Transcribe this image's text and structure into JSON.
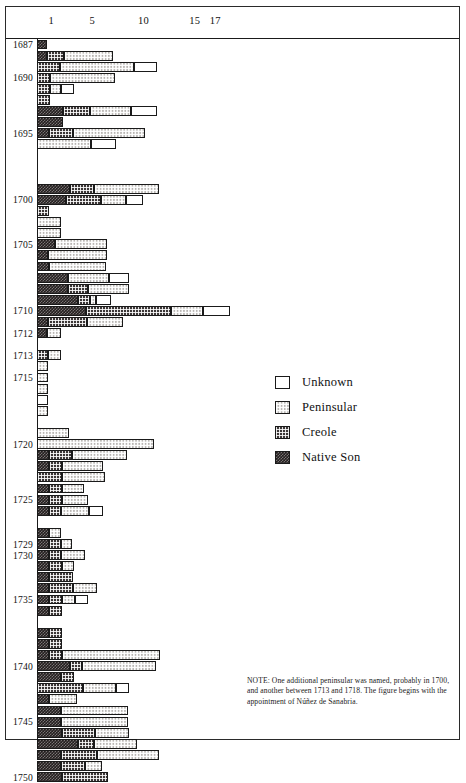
{
  "chart_data": {
    "type": "bar",
    "orientation": "horizontal",
    "stacked": true,
    "title": "",
    "xlabel": "",
    "ylabel": "",
    "xlim": [
      0,
      20
    ],
    "xticks": [
      1,
      5,
      10,
      15,
      17
    ],
    "xtick_labels": [
      "1",
      "5",
      "10",
      "15",
      "17"
    ],
    "grid": false,
    "legend_position": "center-right",
    "series_order": [
      "Native Son",
      "Creole",
      "Peninsular",
      "Unknown"
    ],
    "legend": [
      {
        "label": "Unknown",
        "pattern": "white",
        "color": "#ffffff"
      },
      {
        "label": "Peninsular",
        "pattern": "light-checker",
        "color": "#b9b6b2"
      },
      {
        "label": "Creole",
        "pattern": "medium-checker",
        "color": "#3b3636"
      },
      {
        "label": "Native Son",
        "pattern": "dark-checker",
        "color": "#241f1f"
      }
    ],
    "ytick_labels": [
      "1687",
      "1690",
      "1695",
      "1700",
      "1705",
      "1710",
      "1712",
      "1713",
      "1715",
      "1720",
      "1725",
      "1729",
      "1730",
      "1735",
      "1740",
      "1745",
      "1750"
    ],
    "categories": [
      "1687",
      "1688",
      "1689",
      "1690",
      "1691",
      "1692",
      "1693",
      "1694",
      "1695",
      "1696",
      "1697",
      "1698",
      "1699",
      "1700",
      "1701",
      "1702",
      "1703",
      "1704",
      "1705",
      "1706",
      "1707",
      "1708",
      "1709",
      "1710",
      "1711",
      "1712",
      "1713",
      "1714",
      "1715",
      "1716",
      "1717",
      "1718",
      "1719",
      "1720",
      "1721",
      "1722",
      "1723",
      "1724",
      "1725",
      "1726",
      "1727",
      "1728",
      "1729",
      "1730",
      "1731",
      "1732",
      "1733",
      "1734",
      "1735",
      "1736",
      "1737",
      "1738",
      "1739",
      "1740",
      "1741",
      "1742",
      "1743",
      "1744",
      "1745",
      "1746",
      "1747",
      "1748",
      "1749",
      "1750"
    ],
    "rows": [
      {
        "year": "1687",
        "label": "1687",
        "native_son": 1.0,
        "creole": 0.0,
        "peninsular": 0.0,
        "unknown": 0.0
      },
      {
        "year": "1688",
        "label": "",
        "native_son": 1.0,
        "creole": 1.6,
        "peninsular": 4.8,
        "unknown": 0.0
      },
      {
        "year": "1689",
        "label": "",
        "native_son": 0.0,
        "creole": 2.2,
        "peninsular": 7.3,
        "unknown": 2.2
      },
      {
        "year": "1690",
        "label": "1690",
        "native_son": 0.0,
        "creole": 1.3,
        "peninsular": 6.3,
        "unknown": 0.0
      },
      {
        "year": "1691",
        "label": "",
        "native_son": 0.0,
        "creole": 1.3,
        "peninsular": 1.0,
        "unknown": 1.3
      },
      {
        "year": "1692",
        "label": "",
        "native_son": 0.0,
        "creole": 1.3,
        "peninsular": 0.0,
        "unknown": 0.0
      },
      {
        "year": "1693",
        "label": "",
        "native_son": 2.5,
        "creole": 2.7,
        "peninsular": 4.0,
        "unknown": 2.5
      },
      {
        "year": "1694",
        "label": "",
        "native_son": 2.5,
        "creole": 0.0,
        "peninsular": 0.0,
        "unknown": 0.0
      },
      {
        "year": "1695",
        "label": "1695",
        "native_son": 1.2,
        "creole": 2.3,
        "peninsular": 7.0,
        "unknown": 0.0
      },
      {
        "year": "1696",
        "label": "",
        "native_son": 0.0,
        "creole": 0.0,
        "peninsular": 5.3,
        "unknown": 2.4
      },
      {
        "year": "1697",
        "label": "",
        "native_son": 0.0,
        "creole": 0.0,
        "peninsular": 0.0,
        "unknown": 0.0
      },
      {
        "year": "1698",
        "label": "",
        "native_son": 0.0,
        "creole": 0.0,
        "peninsular": 0.0,
        "unknown": 0.0
      },
      {
        "year": "1699",
        "label": "",
        "native_son": 0.0,
        "creole": 0.0,
        "peninsular": 0.0,
        "unknown": 0.0
      },
      {
        "year": "1700",
        "label": "",
        "native_son": 3.2,
        "creole": 2.4,
        "peninsular": 6.3,
        "unknown": 0.0
      },
      {
        "year": "1701",
        "label": "1700",
        "native_son": 2.8,
        "creole": 3.4,
        "peninsular": 2.5,
        "unknown": 1.6
      },
      {
        "year": "1702",
        "label": "",
        "native_son": 0.0,
        "creole": 1.2,
        "peninsular": 0.0,
        "unknown": 0.0
      },
      {
        "year": "1703",
        "label": "",
        "native_son": 0.0,
        "creole": 0.0,
        "peninsular": 2.3,
        "unknown": 0.0
      },
      {
        "year": "1704",
        "label": "",
        "native_son": 0.0,
        "creole": 0.0,
        "peninsular": 2.3,
        "unknown": 0.0
      },
      {
        "year": "1705",
        "label": "1705",
        "native_son": 1.8,
        "creole": 0.0,
        "peninsular": 5.0,
        "unknown": 0.0
      },
      {
        "year": "1706",
        "label": "",
        "native_son": 1.1,
        "creole": 0.0,
        "peninsular": 5.7,
        "unknown": 0.0
      },
      {
        "year": "1707",
        "label": "",
        "native_son": 1.2,
        "creole": 0.0,
        "peninsular": 5.5,
        "unknown": 0.0
      },
      {
        "year": "1708",
        "label": "",
        "native_son": 3.0,
        "creole": 0.0,
        "peninsular": 4.0,
        "unknown": 2.0
      },
      {
        "year": "1709",
        "label": "",
        "native_son": 3.0,
        "creole": 2.0,
        "peninsular": 4.0,
        "unknown": 0.0
      },
      {
        "year": "1710",
        "label": "",
        "native_son": 4.0,
        "creole": 1.2,
        "peninsular": 0.6,
        "unknown": 1.4
      },
      {
        "year": "1711",
        "label": "1710",
        "native_son": 4.8,
        "creole": 8.3,
        "peninsular": 3.1,
        "unknown": 2.6
      },
      {
        "year": "1712",
        "label": "",
        "native_son": 1.1,
        "creole": 3.8,
        "peninsular": 3.5,
        "unknown": 0.0
      },
      {
        "year": "1713",
        "label": "1712",
        "native_son": 1.0,
        "creole": 0.0,
        "peninsular": 1.3,
        "unknown": 0.0
      },
      {
        "year": "1714",
        "label": "",
        "native_son": 0.0,
        "creole": 0.0,
        "peninsular": 0.0,
        "unknown": 0.0
      },
      {
        "year": "1715",
        "label": "1713",
        "native_son": 0.0,
        "creole": 1.1,
        "peninsular": 1.2,
        "unknown": 0.0
      },
      {
        "year": "1716",
        "label": "",
        "native_son": 0.0,
        "creole": 0.0,
        "peninsular": 1.1,
        "unknown": 0.0
      },
      {
        "year": "1717",
        "label": "1715",
        "native_son": 0.0,
        "creole": 0.0,
        "peninsular": 1.1,
        "unknown": 0.0
      },
      {
        "year": "1718",
        "label": "",
        "native_son": 0.0,
        "creole": 0.0,
        "peninsular": 1.1,
        "unknown": 0.0
      },
      {
        "year": "1719",
        "label": "",
        "native_son": 0.0,
        "creole": 0.0,
        "peninsular": 0.0,
        "unknown": 1.1
      },
      {
        "year": "1720",
        "label": "",
        "native_son": 0.0,
        "creole": 0.0,
        "peninsular": 1.1,
        "unknown": 0.0
      },
      {
        "year": "1721",
        "label": "",
        "native_son": 0.0,
        "creole": 0.0,
        "peninsular": 0.0,
        "unknown": 0.0
      },
      {
        "year": "1722",
        "label": "",
        "native_son": 0.0,
        "creole": 0.0,
        "peninsular": 3.1,
        "unknown": 0.0
      },
      {
        "year": "1723",
        "label": "1720",
        "native_son": 0.0,
        "creole": 0.0,
        "peninsular": 11.4,
        "unknown": 0.0
      },
      {
        "year": "1724",
        "label": "",
        "native_son": 1.2,
        "creole": 2.2,
        "peninsular": 5.4,
        "unknown": 0.0
      },
      {
        "year": "1725",
        "label": "",
        "native_son": 1.2,
        "creole": 1.2,
        "peninsular": 4.0,
        "unknown": 0.0
      },
      {
        "year": "1726",
        "label": "",
        "native_son": 0.0,
        "creole": 2.4,
        "peninsular": 4.2,
        "unknown": 0.0
      },
      {
        "year": "1727",
        "label": "",
        "native_son": 1.2,
        "creole": 1.2,
        "peninsular": 2.2,
        "unknown": 0.0
      },
      {
        "year": "1728",
        "label": "1725",
        "native_son": 1.2,
        "creole": 1.2,
        "peninsular": 2.6,
        "unknown": 0.0
      },
      {
        "year": "1729",
        "label": "",
        "native_son": 1.2,
        "creole": 1.1,
        "peninsular": 2.8,
        "unknown": 1.3
      },
      {
        "year": "1730",
        "label": "",
        "native_son": 0.0,
        "creole": 0.0,
        "peninsular": 0.0,
        "unknown": 0.0
      },
      {
        "year": "1731",
        "label": "",
        "native_son": 1.2,
        "creole": 0.0,
        "peninsular": 1.1,
        "unknown": 0.0
      },
      {
        "year": "1732",
        "label": "1729",
        "native_son": 1.2,
        "creole": 1.1,
        "peninsular": 1.1,
        "unknown": 0.0
      },
      {
        "year": "1733",
        "label": "1730",
        "native_son": 1.2,
        "creole": 1.1,
        "peninsular": 2.4,
        "unknown": 0.0
      },
      {
        "year": "1734",
        "label": "",
        "native_son": 1.2,
        "creole": 1.2,
        "peninsular": 1.2,
        "unknown": 0.0
      },
      {
        "year": "1735",
        "label": "",
        "native_son": 1.2,
        "creole": 2.3,
        "peninsular": 0.0,
        "unknown": 0.0
      },
      {
        "year": "1736",
        "label": "",
        "native_son": 1.2,
        "creole": 2.3,
        "peninsular": 2.4,
        "unknown": 0.0
      },
      {
        "year": "1737",
        "label": "1735",
        "native_son": 1.2,
        "creole": 1.2,
        "peninsular": 1.3,
        "unknown": 1.3
      },
      {
        "year": "1738",
        "label": "",
        "native_son": 1.2,
        "creole": 1.2,
        "peninsular": 0.0,
        "unknown": 0.0
      },
      {
        "year": "1739",
        "label": "",
        "native_son": 0.0,
        "creole": 0.0,
        "peninsular": 0.0,
        "unknown": 0.0
      },
      {
        "year": "1740",
        "label": "",
        "native_son": 1.2,
        "creole": 1.2,
        "peninsular": 0.0,
        "unknown": 0.0
      },
      {
        "year": "1741",
        "label": "",
        "native_son": 1.2,
        "creole": 1.2,
        "peninsular": 0.0,
        "unknown": 0.0
      },
      {
        "year": "1742",
        "label": "",
        "native_son": 1.2,
        "creole": 1.2,
        "peninsular": 9.6,
        "unknown": 0.0
      },
      {
        "year": "1743",
        "label": "1740",
        "native_son": 3.2,
        "creole": 1.2,
        "peninsular": 7.2,
        "unknown": 0.0
      },
      {
        "year": "1744",
        "label": "",
        "native_son": 2.3,
        "creole": 1.3,
        "peninsular": 0.0,
        "unknown": 0.0
      },
      {
        "year": "1745",
        "label": "",
        "native_son": 0.0,
        "creole": 4.5,
        "peninsular": 3.2,
        "unknown": 1.3
      },
      {
        "year": "1746",
        "label": "",
        "native_son": 1.2,
        "creole": 0.0,
        "peninsular": 2.7,
        "unknown": 0.0
      },
      {
        "year": "1747",
        "label": "",
        "native_son": 2.3,
        "creole": 0.0,
        "peninsular": 6.6,
        "unknown": 0.0
      },
      {
        "year": "1748",
        "label": "1745",
        "native_son": 2.3,
        "creole": 0.0,
        "peninsular": 6.6,
        "unknown": 0.0
      },
      {
        "year": "1749",
        "label": "",
        "native_son": 2.4,
        "creole": 3.3,
        "peninsular": 3.3,
        "unknown": 0.0
      },
      {
        "year": "1750",
        "label": "",
        "native_son": 4.0,
        "creole": 1.6,
        "peninsular": 4.2,
        "unknown": 0.0
      },
      {
        "year": "1751",
        "label": "",
        "native_son": 2.3,
        "creole": 3.6,
        "peninsular": 6.0,
        "unknown": 0.0
      },
      {
        "year": "1752",
        "label": "",
        "native_son": 2.3,
        "creole": 2.4,
        "peninsular": 1.6,
        "unknown": 0.0
      },
      {
        "year": "1753",
        "label": "1750",
        "native_son": 2.4,
        "creole": 4.5,
        "peninsular": 0.0,
        "unknown": 0.0
      }
    ]
  },
  "note": {
    "text": "NOTE: One additional peninsular was named, probably in 1700, and another between 1713 and 1718. The figure begins with the appointment of Núñez de Sanabria."
  }
}
